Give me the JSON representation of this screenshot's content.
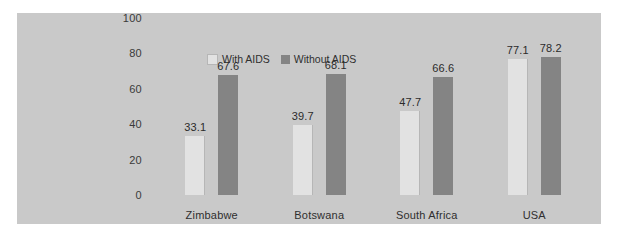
{
  "chart_data": {
    "type": "bar",
    "title": "",
    "xlabel": "",
    "ylabel": "",
    "ylim": [
      0,
      100
    ],
    "yticks": [
      "0",
      "20",
      "40",
      "60",
      "80",
      "100"
    ],
    "grid": false,
    "legend_position": "top-center",
    "categories": [
      "Zimbabwe",
      "Botswana",
      "South Africa",
      "USA"
    ],
    "series": [
      {
        "name": "With AIDS",
        "color": "#e2e2e2",
        "values": [
          33.1,
          39.7,
          47.7,
          77.1
        ],
        "labels": [
          "33.1",
          "39.7",
          "47.7",
          "77.1"
        ]
      },
      {
        "name": "Without AIDS",
        "color": "#848484",
        "values": [
          67.6,
          68.1,
          66.6,
          78.2
        ],
        "labels": [
          "67.6",
          "68.1",
          "66.6",
          "78.2"
        ]
      }
    ]
  },
  "colors": {
    "panel_background": "#c9c9c9",
    "page_background": "#ffffff",
    "with_aids": "#e2e2e2",
    "without_aids": "#848484",
    "text": "#2f2f2f"
  }
}
